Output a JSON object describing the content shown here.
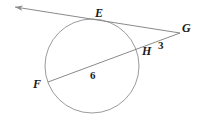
{
  "figure": {
    "type": "circle-tangent-secant-geometry-diagram",
    "background_color": "#ffffff",
    "stroke_color": "#8a8a8a",
    "label_color": "#1a1a1a",
    "points": {
      "E": {
        "label": "E",
        "x": 97,
        "y": 21,
        "role": "tangent-point-on-circle"
      },
      "F": {
        "label": "F",
        "x": 48,
        "y": 82,
        "role": "secant-far-intersection-on-circle"
      },
      "G": {
        "label": "G",
        "x": 180,
        "y": 33,
        "role": "external-point"
      },
      "H": {
        "label": "H",
        "x": 137,
        "y": 50,
        "role": "secant-near-intersection-on-circle"
      }
    },
    "segment_labels": {
      "HG": {
        "text": "3",
        "x": 161,
        "y": 45
      },
      "FH": {
        "text": "6",
        "x": 93,
        "y": 76
      }
    },
    "circle": {
      "cx": 92,
      "cy": 66,
      "r": 47
    },
    "tangent_line": {
      "name": "tangent-through-E-to-G",
      "arrow_tip": {
        "x": 11,
        "y": 7
      },
      "from": "G",
      "through": "E",
      "has_arrowhead": true
    },
    "secant_line": {
      "name": "secant-F-H-G",
      "from": "F",
      "through": "H",
      "to": "G",
      "has_arrowhead": false
    }
  }
}
